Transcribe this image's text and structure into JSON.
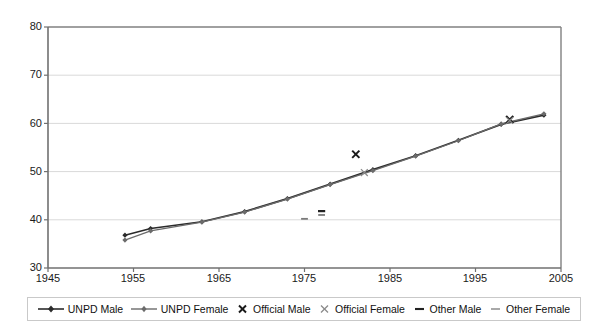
{
  "chart_data": {
    "type": "line",
    "title": "",
    "xlabel": "",
    "ylabel": "",
    "xlim": [
      1945,
      2005
    ],
    "ylim": [
      30,
      80
    ],
    "xticks": [
      1945,
      1955,
      1965,
      1975,
      1985,
      1995,
      2005
    ],
    "yticks": [
      30,
      40,
      50,
      60,
      70,
      80
    ],
    "grid": "horizontal",
    "legend_position": "bottom",
    "series": [
      {
        "name": "UNPD Male",
        "type": "line",
        "marker": "diamond",
        "color": "#2b2b2b",
        "x": [
          1954,
          1957,
          1963,
          1968,
          1973,
          1978,
          1983,
          1988,
          1993,
          1998,
          2003
        ],
        "values": [
          36.8,
          38.2,
          39.6,
          41.7,
          44.4,
          47.4,
          50.4,
          53.3,
          56.5,
          59.8,
          61.7
        ]
      },
      {
        "name": "UNPD Female",
        "type": "line",
        "marker": "diamond",
        "color": "#6b6b6b",
        "x": [
          1954,
          1957,
          1963,
          1968,
          1973,
          1978,
          1983,
          1988,
          1993,
          1998,
          2003
        ],
        "values": [
          35.8,
          37.7,
          39.5,
          41.6,
          44.3,
          47.3,
          50.2,
          53.2,
          56.4,
          59.9,
          62.0
        ]
      },
      {
        "name": "Official Male",
        "type": "scatter",
        "marker": "x-bold",
        "color": "#1a1a1a",
        "x": [
          1981,
          1999
        ],
        "values": [
          53.6,
          60.8
        ]
      },
      {
        "name": "Official Female",
        "type": "scatter",
        "marker": "x-light",
        "color": "#8a8a8a",
        "x": [
          1982,
          1999
        ],
        "values": [
          49.8,
          60.6
        ]
      },
      {
        "name": "Other Male",
        "type": "scatter",
        "marker": "dash-bold",
        "color": "#222222",
        "x": [
          1977
        ],
        "values": [
          41.8
        ]
      },
      {
        "name": "Other Female",
        "type": "scatter",
        "marker": "dash-light",
        "color": "#7a7a7a",
        "x": [
          1975,
          1977
        ],
        "values": [
          40.2,
          41.0
        ]
      }
    ]
  },
  "axes": {
    "y_tick_labels": [
      "80",
      "70",
      "60",
      "50",
      "40",
      "30"
    ],
    "x_tick_labels": [
      "1945",
      "1955",
      "1965",
      "1975",
      "1985",
      "1995",
      "2005"
    ]
  },
  "legend": {
    "items": [
      {
        "label": "UNPD Male",
        "marker": "line-diamond-dark",
        "icon": "line-with-diamond-marker-icon"
      },
      {
        "label": "UNPD Female",
        "marker": "line-diamond-gray",
        "icon": "line-with-diamond-marker-icon"
      },
      {
        "label": "Official Male",
        "marker": "x-bold",
        "icon": "x-marker-icon"
      },
      {
        "label": "Official Female",
        "marker": "x-light",
        "icon": "x-marker-icon"
      },
      {
        "label": "Other Male",
        "marker": "dash-bold",
        "icon": "dash-marker-icon"
      },
      {
        "label": "Other Female",
        "marker": "dash-light",
        "icon": "dash-marker-icon"
      }
    ]
  },
  "colors": {
    "male_line": "#2b2b2b",
    "female_line": "#6b6b6b",
    "axis": "#808080",
    "grid": "#d9d9d9",
    "background": "#ffffff",
    "text": "#1a1a1a"
  }
}
